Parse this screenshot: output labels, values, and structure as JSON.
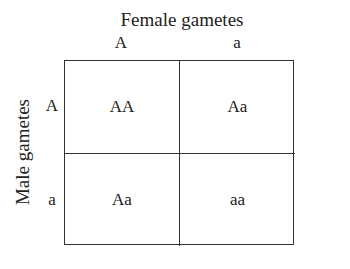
{
  "diagram": {
    "type": "punnett-square",
    "column_axis_title": "Female gametes",
    "row_axis_title": "Male gametes",
    "columns": [
      "A",
      "a"
    ],
    "rows": [
      "A",
      "a"
    ],
    "cells": [
      [
        "AA",
        "Aa"
      ],
      [
        "Aa",
        "aa"
      ]
    ],
    "colors": {
      "lines": "#333333",
      "text": "#222222",
      "background": "#ffffff"
    }
  }
}
